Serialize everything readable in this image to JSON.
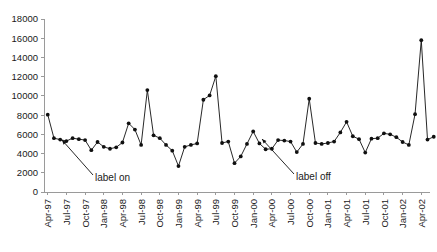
{
  "chart_data": {
    "type": "line",
    "title": "",
    "subtitle": "",
    "xlabel": "",
    "ylabel": "",
    "ylim": [
      0,
      18000
    ],
    "ytick_step": 2000,
    "grid": false,
    "legend": null,
    "marker": "filled-circle",
    "line_color": "#101010",
    "marker_color": "#101010",
    "axis_color": "#9a9a9a",
    "ytick_labels": [
      "0",
      "2000",
      "4000",
      "6000",
      "8000",
      "10000",
      "12000",
      "14000",
      "16000",
      "18000"
    ],
    "ytick_values": [
      0,
      2000,
      4000,
      6000,
      8000,
      10000,
      12000,
      14000,
      16000,
      18000
    ],
    "xtick_labels": [
      "Apr-97",
      "Jul-97",
      "Oct-97",
      "Jan-98",
      "Apr-98",
      "Jul-98",
      "Oct-98",
      "Jan-99",
      "Apr-99",
      "Jul-99",
      "Oct-99",
      "Jan-00",
      "Apr-00",
      "Jul-00",
      "Oct-00",
      "Jan-01",
      "Apr-01",
      "Jul-01",
      "Oct-01",
      "Jan-02",
      "Apr-02"
    ],
    "xtick_interval_months": 3,
    "x_start_label": "Apr-97",
    "x_series_step_months": 1,
    "x": [
      "Apr-97",
      "May-97",
      "Jun-97",
      "Jul-97",
      "Aug-97",
      "Sep-97",
      "Oct-97",
      "Nov-97",
      "Dec-97",
      "Jan-98",
      "Feb-98",
      "Mar-98",
      "Apr-98",
      "May-98",
      "Jun-98",
      "Jul-98",
      "Aug-98",
      "Sep-98",
      "Oct-98",
      "Nov-98",
      "Dec-98",
      "Jan-99",
      "Feb-99",
      "Mar-99",
      "Apr-99",
      "May-99",
      "Jun-99",
      "Jul-99",
      "Aug-99",
      "Sep-99",
      "Oct-99",
      "Nov-99",
      "Dec-99",
      "Jan-00",
      "Feb-00",
      "Mar-00",
      "Apr-00",
      "May-00",
      "Jun-00",
      "Jul-00",
      "Aug-00",
      "Sep-00",
      "Oct-00",
      "Nov-00",
      "Dec-00",
      "Jan-01",
      "Feb-01",
      "Mar-01",
      "Apr-01",
      "May-01",
      "Jun-01",
      "Jul-01",
      "Aug-01",
      "Sep-01",
      "Oct-01",
      "Nov-01",
      "Dec-01",
      "Jan-02",
      "Feb-02",
      "Mar-02",
      "Apr-02",
      "May-02",
      "Jun-02"
    ],
    "values": [
      8050,
      5600,
      5450,
      5300,
      5600,
      5500,
      5400,
      4350,
      5200,
      4700,
      4500,
      4650,
      5150,
      7150,
      6500,
      4900,
      10600,
      5900,
      5600,
      4900,
      4300,
      2700,
      4700,
      4900,
      5050,
      9600,
      10050,
      12050,
      5100,
      5250,
      3000,
      3700,
      5000,
      6300,
      5050,
      4450,
      4500,
      5400,
      5350,
      5250,
      4150,
      5000,
      9700,
      5100,
      5000,
      5100,
      5250,
      6200,
      7300,
      5800,
      5500,
      4100,
      5550,
      5600,
      6100,
      6000,
      5700,
      5200,
      4900,
      8100,
      15800,
      5450,
      5750
    ],
    "annotations": [
      {
        "id": "label-on",
        "text": "label on",
        "text_x": 95,
        "text_y": 181,
        "arrow_from_x": 93,
        "arrow_from_y": 175,
        "arrow_to_x": 62,
        "arrow_to_y": 140
      },
      {
        "id": "label-off",
        "text": "label off",
        "text_x": 296,
        "text_y": 180,
        "arrow_from_x": 294,
        "arrow_from_y": 174,
        "arrow_to_x": 262,
        "arrow_to_y": 139
      }
    ]
  },
  "plot_geometry": {
    "left": 44,
    "right": 430,
    "top": 19,
    "bottom": 192
  }
}
